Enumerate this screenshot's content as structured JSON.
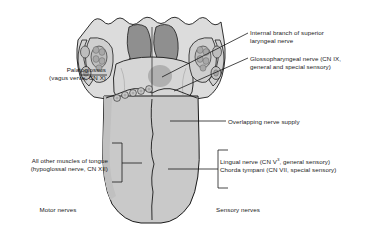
{
  "figure": {
    "background_color": "#ffffff",
    "text_color": "#1a1a1a",
    "line_color": "#1a1a1a"
  },
  "colors": {
    "tongue_body": "#c9c9c9",
    "tongue_body_light": "#d6d6d6",
    "pharynx_pale": "#dcdcdc",
    "epiglottis_dark": "#8f8f8f",
    "tonsil_mid": "#b0b0b0",
    "outline": "#1a1a1a"
  },
  "labels": {
    "internal_laryngeal": {
      "line1": "Internal branch of superior",
      "line2": "laryngeal nerve"
    },
    "glossopharyngeal": {
      "line1": "Glossopharyngeal nerve (CN IX,",
      "line2": "general and special sensory)"
    },
    "palatoglossus": {
      "line1": "Palatoglossus",
      "line2": "(vagus verve, CN X)"
    },
    "overlapping": {
      "line1": "Overlapping nerve supply"
    },
    "all_other_muscles": {
      "line1": "All other muscles of tongue",
      "line2": "(hypoglossal nerve, CN XII)"
    },
    "lingual_nerve": {
      "prefix": "Lingual nerve (CN V",
      "superscript": "3",
      "suffix": ", general sensory)"
    },
    "chorda_tympani": {
      "line1": "Chorda tympani (CN VII, special sensory)"
    },
    "motor_nerves": {
      "line1": "Motor nerves"
    },
    "sensory_nerves": {
      "line1": "Sensory nerves"
    }
  },
  "anatomy_parts": [
    "epiglottis",
    "vallecula",
    "lingual-tonsil",
    "palatine-tonsil",
    "palatoglossal-arch",
    "circumvallate-papillae",
    "sulcus-terminalis",
    "median-sulcus",
    "tongue-body"
  ]
}
